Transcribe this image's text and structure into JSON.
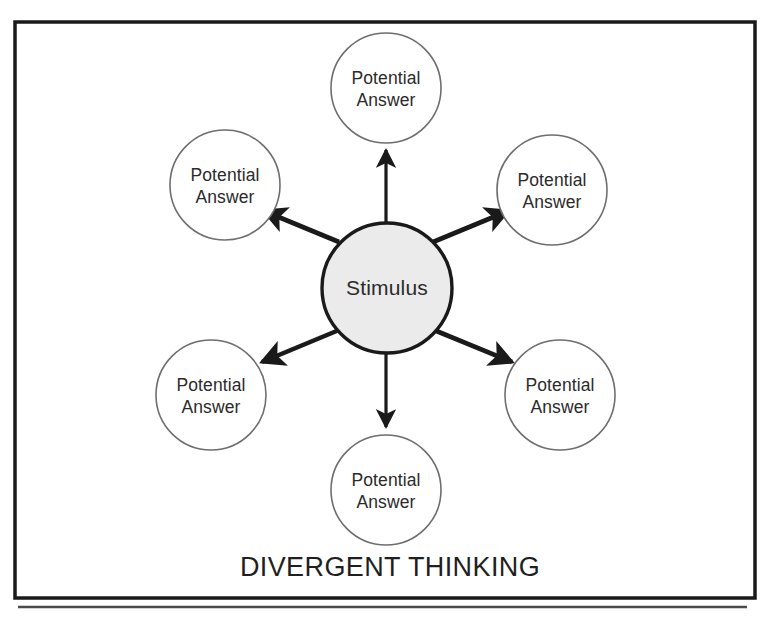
{
  "figure": {
    "caption": "DIVERGENT THINKING",
    "center_node": {
      "label": "Stimulus",
      "fill_color": "#ebebeb",
      "stroke_color": "#1a1a1a"
    },
    "peripheral_nodes": [
      {
        "line1": "Potential",
        "line2": "Answer",
        "position": "top"
      },
      {
        "line1": "Potential",
        "line2": "Answer",
        "position": "top-right"
      },
      {
        "line1": "Potential",
        "line2": "Answer",
        "position": "bottom-right"
      },
      {
        "line1": "Potential",
        "line2": "Answer",
        "position": "bottom"
      },
      {
        "line1": "Potential",
        "line2": "Answer",
        "position": "bottom-left"
      },
      {
        "line1": "Potential",
        "line2": "Answer",
        "position": "top-left"
      }
    ],
    "node_stroke_color": "#6e6e6e",
    "arrow_color": "#1a1a1a",
    "frame_color": "#1a1a1a",
    "rule_color": "#4a4a4a",
    "background_color": "#ffffff"
  }
}
